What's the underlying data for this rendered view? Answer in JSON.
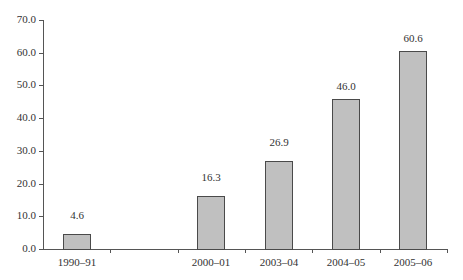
{
  "chart_data": {
    "type": "bar",
    "title": "",
    "xlabel": "",
    "ylabel": "",
    "categories": [
      "1990–91",
      "",
      "2000–01",
      "2003–04",
      "2004–05",
      "2005–06"
    ],
    "values": [
      4.6,
      null,
      16.3,
      26.9,
      46.0,
      60.6
    ],
    "value_labels": [
      "4.6",
      "",
      "16.3",
      "26.9",
      "46.0",
      "60.6"
    ],
    "ylim": [
      0,
      70
    ],
    "yticks": [
      "0.0",
      "10.0",
      "20.0",
      "30.0",
      "40.0",
      "50.0",
      "60.0",
      "70.0"
    ],
    "grid": false,
    "legend": null,
    "bar_color": "#c0c0c0",
    "bar_edge_color": "#4a4a4a"
  }
}
